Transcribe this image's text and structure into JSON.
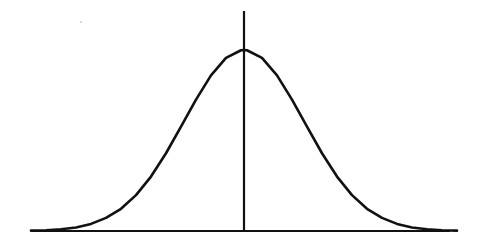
{
  "figure": {
    "description": "Hand-drawn symmetric bell-shaped normal distribution curve with a horizontal baseline axis and a vertical line at the mean",
    "background_color": "#ffffff",
    "ink_color": "#111111",
    "width": 478,
    "height": 246
  },
  "chart_data": {
    "type": "line",
    "title": "",
    "subtitle": "",
    "xlabel": "",
    "ylabel": "",
    "legend": [],
    "legend_position": "none",
    "grid": false,
    "axes": {
      "x_axis_visible": true,
      "y_axis_visible": false,
      "x_axis_tick_labels": [],
      "y_axis_tick_labels": [],
      "xlim": [
        -4,
        4
      ],
      "ylim": [
        0,
        1.08
      ]
    },
    "annotations": [
      {
        "name": "mean-line",
        "type": "vertical-line",
        "x": 0,
        "y_from": 0,
        "y_to": 1.08,
        "label": ""
      }
    ],
    "series": [
      {
        "name": "normal-pdf",
        "mean": 0,
        "sigma": 1,
        "color": "#111111",
        "x": [
          -3.55,
          -3.3,
          -3.05,
          -2.8,
          -2.55,
          -2.3,
          -2.05,
          -1.8,
          -1.55,
          -1.3,
          -1.05,
          -0.8,
          -0.55,
          -0.3,
          -0.05,
          0,
          0.05,
          0.3,
          0.55,
          0.8,
          1.05,
          1.3,
          1.55,
          1.8,
          2.05,
          2.3,
          2.55,
          2.8,
          3.05,
          3.3,
          3.55
        ],
        "values": [
          0.0018,
          0.0042,
          0.0094,
          0.0198,
          0.0392,
          0.0724,
          0.1225,
          0.198,
          0.3008,
          0.4296,
          0.5769,
          0.7261,
          0.8596,
          0.956,
          0.9988,
          1.0,
          0.9988,
          0.956,
          0.8596,
          0.7261,
          0.5769,
          0.4296,
          0.3008,
          0.198,
          0.1225,
          0.0724,
          0.0392,
          0.0198,
          0.0094,
          0.0042,
          0.0018
        ]
      }
    ],
    "geometry_px": {
      "baseline_y": 231,
      "baseline_x_start": 33,
      "baseline_x_end": 450,
      "peak_x": 244,
      "peak_y": 50,
      "mean_line_top_y": 11,
      "curve_left_x": 45,
      "curve_right_x": 456,
      "sigma_px": 60,
      "stroke_width": 2.6
    }
  }
}
